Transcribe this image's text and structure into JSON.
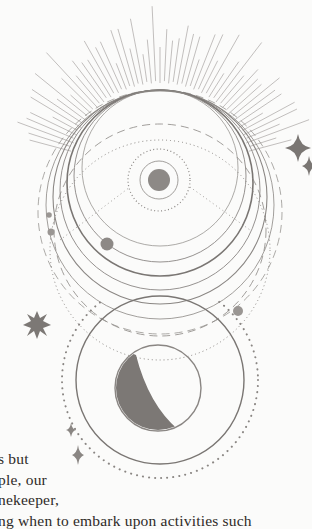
{
  "page": {
    "background": "#fbfbfa",
    "ink_color": "#8a8683",
    "dark_ink_color": "#6e6a67"
  },
  "illustration": {
    "name": "celestial-sun-moon-orbits",
    "elements": [
      "sun-rays",
      "nested-orbit-arcs",
      "central-planet",
      "orbiting-planets",
      "moon-phase",
      "dotted-orbits",
      "stars",
      "sparkles"
    ]
  },
  "body_text": {
    "lines": [
      "s but",
      "ple, our",
      "nekeeper,",
      "ng when to embark upon activities such"
    ]
  }
}
